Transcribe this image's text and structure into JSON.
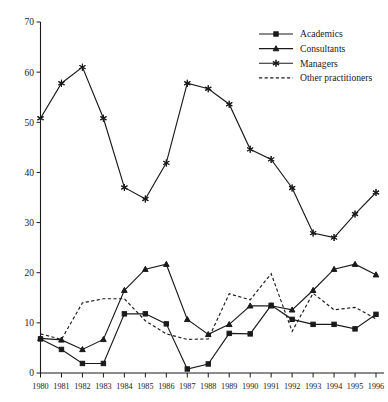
{
  "chart_data": {
    "type": "line",
    "title": "",
    "xlabel": "",
    "ylabel": "",
    "xlim": [
      1980,
      1996
    ],
    "ylim": [
      0,
      70
    ],
    "ytick_step": 10,
    "grid": false,
    "legend_position": "top-right",
    "x": [
      1980,
      1981,
      1982,
      1983,
      1984,
      1985,
      1986,
      1987,
      1988,
      1989,
      1990,
      1991,
      1992,
      1993,
      1994,
      1995,
      1996
    ],
    "xtick_labels": [
      "1980",
      "1981",
      "1982",
      "1983",
      "1984",
      "1985",
      "1986",
      "1987",
      "1988",
      "1989",
      "1990",
      "1991",
      "1992",
      "1993",
      "1994",
      "1995",
      "1996"
    ],
    "ytick_labels": [
      "0",
      "10",
      "20",
      "30",
      "40",
      "50",
      "60",
      "70"
    ],
    "ytick_values": [
      0,
      10,
      20,
      30,
      40,
      50,
      60,
      70
    ],
    "series": [
      {
        "name": "Academics",
        "marker": "square",
        "style": "solid",
        "color": "#1a1a1a",
        "values": [
          6.8,
          4.7,
          1.9,
          1.9,
          11.8,
          11.8,
          9.8,
          0.8,
          1.8,
          7.9,
          7.8,
          13.5,
          10.7,
          9.7,
          9.7,
          8.8,
          11.7
        ]
      },
      {
        "name": "Consultants",
        "marker": "triangle",
        "style": "solid",
        "color": "#1a1a1a",
        "values": [
          6.9,
          6.6,
          4.7,
          6.7,
          16.5,
          20.7,
          21.7,
          10.7,
          7.7,
          9.7,
          13.4,
          13.4,
          12.6,
          16.5,
          20.7,
          21.7,
          19.6
        ]
      },
      {
        "name": "Managers",
        "marker": "star",
        "style": "solid",
        "color": "#1a1a1a",
        "values": [
          50.8,
          57.8,
          61.0,
          50.8,
          37.0,
          34.7,
          41.9,
          57.8,
          56.7,
          53.6,
          44.6,
          42.6,
          36.9,
          27.9,
          27.0,
          31.7,
          36.0
        ]
      },
      {
        "name": "Other practitioners",
        "marker": "none",
        "style": "dashed",
        "color": "#1a1a1a",
        "values": [
          7.8,
          6.7,
          14.0,
          14.8,
          14.8,
          10.4,
          7.8,
          6.7,
          6.8,
          15.8,
          14.6,
          19.8,
          8.3,
          15.9,
          12.6,
          13.1,
          10.8
        ]
      }
    ],
    "legend": [
      {
        "label": "Academics",
        "marker": "square",
        "style": "solid"
      },
      {
        "label": "Consultants",
        "marker": "triangle",
        "style": "solid"
      },
      {
        "label": "Managers",
        "marker": "star",
        "style": "solid"
      },
      {
        "label": "Other practitioners",
        "marker": "none",
        "style": "dashed"
      }
    ]
  }
}
